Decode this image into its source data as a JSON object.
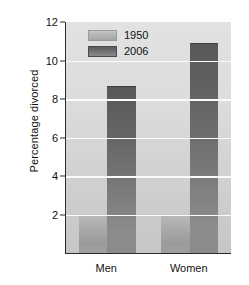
{
  "chart_data": {
    "type": "bar",
    "title": "",
    "subtitle": "",
    "xlabel": "",
    "ylabel": "Percentage divorced",
    "categories": [
      "Men",
      "Women"
    ],
    "series": [
      {
        "name": "1950",
        "values": [
          2.0,
          2.0
        ],
        "color": "#b0b0b0"
      },
      {
        "name": "2006",
        "values": [
          8.7,
          10.9
        ],
        "color": "#6b6b6b"
      }
    ],
    "ylim": [
      0,
      12
    ],
    "yticks": [
      2,
      4,
      6,
      8,
      10,
      12
    ],
    "ytick_labels": [
      "2",
      "4",
      "6",
      "8",
      "10",
      "12"
    ],
    "grid": "horizontal",
    "legend_position": "top-left-inside",
    "annotations": []
  },
  "axes": {
    "y_title": "Percentage divorced",
    "ticks": [
      {
        "value": 12,
        "label": "12"
      },
      {
        "value": 10,
        "label": "10"
      },
      {
        "value": 8,
        "label": "8"
      },
      {
        "value": 6,
        "label": "6"
      },
      {
        "value": 4,
        "label": "4"
      },
      {
        "value": 2,
        "label": "2"
      }
    ],
    "category_labels": [
      {
        "label": "Men"
      },
      {
        "label": "Women"
      }
    ]
  },
  "legend": {
    "entries": [
      {
        "label": "1950",
        "swatch": "legend-swatch-1950"
      },
      {
        "label": "2006",
        "swatch": "legend-swatch-2006"
      }
    ]
  },
  "bars": [
    {
      "name": "bar-men-1950",
      "group": "Men",
      "series": "1950",
      "value": 2.0
    },
    {
      "name": "bar-men-2006",
      "group": "Men",
      "series": "2006",
      "value": 8.7
    },
    {
      "name": "bar-women-1950",
      "group": "Women",
      "series": "1950",
      "value": 2.0
    },
    {
      "name": "bar-women-2006",
      "group": "Women",
      "series": "2006",
      "value": 10.9
    }
  ],
  "colors": {
    "plot_background": "#d9d9d9",
    "gridline": "#fbfbfb",
    "axis": "#2b2b2b",
    "series_1950": "#b0b0b0",
    "series_2006": "#6b6b6b",
    "text": "#111111",
    "page_background": "#ffffff"
  }
}
